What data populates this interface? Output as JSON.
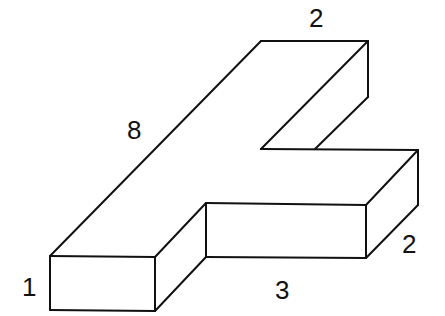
{
  "diagram": {
    "type": "isometric-solid",
    "stroke_color": "#111111",
    "background": "#ffffff",
    "labels": {
      "top_width": "2",
      "long_edge": "8",
      "right_depth": "2",
      "height": "1",
      "front_length": "3"
    }
  }
}
